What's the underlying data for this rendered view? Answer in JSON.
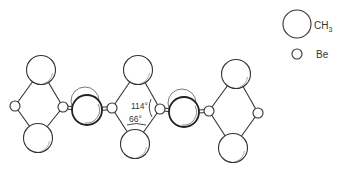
{
  "figure": {
    "angles": {
      "be_angle_label": "114°",
      "c_angle_label": "66°"
    }
  },
  "legend": {
    "items": [
      {
        "symbol": "large-circle",
        "label_main": "CH",
        "label_sub": "3"
      },
      {
        "symbol": "small-circle",
        "label_main": "Be",
        "label_sub": ""
      }
    ]
  },
  "structure": {
    "ch3_atoms": [
      {
        "x": 41,
        "y": 70,
        "r": 14.5
      },
      {
        "x": 38,
        "y": 138,
        "r": 14.5
      },
      {
        "x": 138,
        "y": 70,
        "r": 14.5
      },
      {
        "x": 135,
        "y": 144,
        "r": 14.5
      },
      {
        "x": 236,
        "y": 74,
        "r": 14.5
      },
      {
        "x": 233,
        "y": 148,
        "r": 14.5
      }
    ],
    "bridge_ch3_atoms": [
      {
        "x": 87,
        "y": 110,
        "r": 15,
        "ghost_x": 85,
        "ghost_y": 101
      },
      {
        "x": 184,
        "y": 112,
        "r": 15,
        "ghost_x": 182,
        "ghost_y": 103
      }
    ],
    "be_atoms": [
      {
        "x": 15,
        "y": 106,
        "r": 5
      },
      {
        "x": 63,
        "y": 107,
        "r": 5
      },
      {
        "x": 112,
        "y": 108,
        "r": 5
      },
      {
        "x": 160,
        "y": 109,
        "r": 5
      },
      {
        "x": 209,
        "y": 111,
        "r": 5
      },
      {
        "x": 258,
        "y": 113,
        "r": 5
      }
    ]
  }
}
